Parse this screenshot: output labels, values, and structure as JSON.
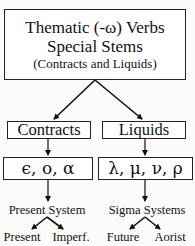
{
  "diagram": {
    "root": {
      "line1": "Thematic (-ω) Verbs",
      "line2": "Special Stems",
      "line3": "(Contracts and Liquids)"
    },
    "branches": [
      {
        "label": "Contracts",
        "letters": "ϵ, ο, α",
        "system": "Present System",
        "children": [
          "Present",
          "Imperf."
        ]
      },
      {
        "label": "Liquids",
        "letters": "λ, μ, ν, ρ",
        "system": "Sigma Systems",
        "children": [
          "Future",
          "Aorist"
        ]
      }
    ],
    "colors": {
      "line": "#111111",
      "background": "#fbfbfa",
      "box_fill": "#ffffff"
    }
  }
}
